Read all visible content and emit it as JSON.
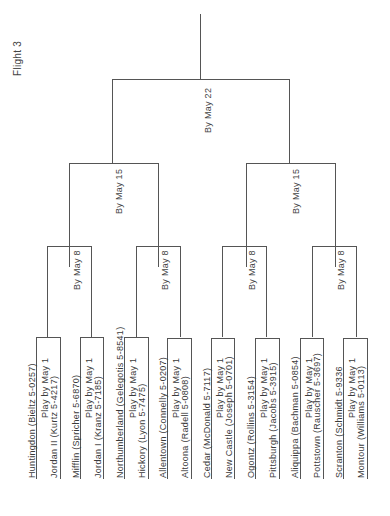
{
  "title": "Flight 3",
  "rounds": {
    "final": "By May 22",
    "semis": [
      "By May 15",
      "By May 15"
    ],
    "quarters": [
      "By May 8",
      "By May 8",
      "By May 8",
      "By May 8"
    ]
  },
  "matches": [
    {
      "team_a": "Huntingdon (Bieltz  5-0257)",
      "label": "Play by May 1",
      "team_b": "Jordan II (Kurtz  5-4217)"
    },
    {
      "team_a": "Mifflin (Spricher  5-6870)",
      "label": "Play by May 1",
      "team_b": "Jordan I (Kranz  5-7185)"
    },
    {
      "team_a": "Northumberland (Gelegotis  5-8541)",
      "label": "Play by May 1",
      "team_b": "Hickory (Lyon  5-7475)"
    },
    {
      "team_a": "Allentown (Connelly  5-0207)",
      "label": "Play by May 1",
      "team_b": "Altoona (Radell  5-0808)"
    },
    {
      "team_a": "Cedar (McDonald  5-7117)",
      "label": "Play by May 1",
      "team_b": "New Castle (Joseph  5-0701)"
    },
    {
      "team_a": "Ogontz (Rollins  5-3154)",
      "label": "Play by May 1",
      "team_b": "Pittsburgh (Jacobs  5-3915)"
    },
    {
      "team_a": "Aliquippa (Bachman  5-0854)",
      "label": "Play by May 1",
      "team_b": "Pottstown (Rauscher  5-3697)"
    },
    {
      "team_a": "Scranton (Schmidt  5-9336",
      "label": "Play by May 1",
      "team_b": "Montour (Williams  5-0113)"
    }
  ]
}
